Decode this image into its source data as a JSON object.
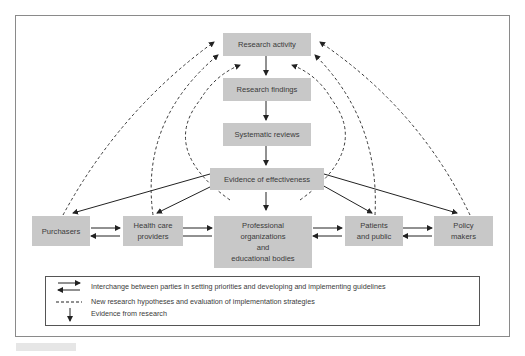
{
  "diagram": {
    "nodes": {
      "research_activity": "Research activity",
      "research_findings": "Research findings",
      "systematic_reviews": "Systematic reviews",
      "evidence_of_effectiveness": "Evidence of effectiveness",
      "purchasers": "Purchasers",
      "health_care_providers": [
        "Health care",
        "providers"
      ],
      "professional_organizations": [
        "Professional",
        "organizations",
        "and",
        "educational bodies"
      ],
      "patients_and_public": [
        "Patients",
        "and public"
      ],
      "policy_makers": [
        "Policy",
        "makers"
      ]
    },
    "legend": {
      "interchange": "Interchange between parties in setting priorities and developing and implementing guidelines",
      "dashed": "New research hypotheses and evaluation of implementation strategies",
      "evidence": "Evidence from research"
    },
    "colors": {
      "node_fill": "#c8c8c8",
      "line": "#222222",
      "frame": "#8a8a8a"
    }
  }
}
